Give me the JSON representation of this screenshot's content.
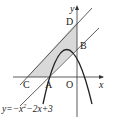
{
  "diagram": {
    "axes": {
      "x_label": "x",
      "y_label": "y",
      "origin_label": "O"
    },
    "points": {
      "A": "A",
      "B": "B",
      "C": "C",
      "D": "D"
    },
    "equation": {
      "prefix": "y=−x",
      "exp": "2",
      "suffix": "−2x+3"
    },
    "colors": {
      "shade": "#d9d9d9",
      "line": "#333333"
    }
  }
}
